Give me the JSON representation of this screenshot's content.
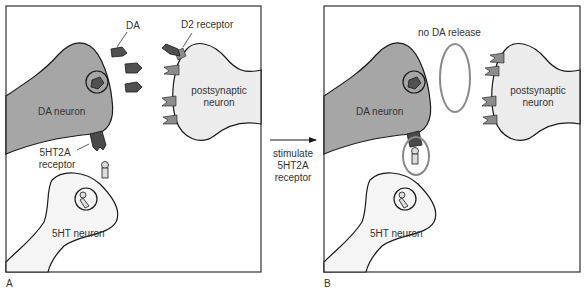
{
  "colors": {
    "da_neuron_fill": "#a6a6a6",
    "postsynaptic_fill": "#ececec",
    "serotonin_neuron_fill": "#f5f5f5",
    "dopamine_molecule": "#505050",
    "d2_receptor": "#8c8c8c",
    "receptor_5ht2a": "#4a4a4a",
    "serotonin_molecule": "#dcdcdc",
    "highlight_ellipse": "#8a8a8a",
    "outline": "#1a1a1a"
  },
  "panel_a": {
    "letter": "A",
    "labels": {
      "da": "DA",
      "d2_receptor": "D2 receptor",
      "da_neuron": "DA neuron",
      "postsynaptic_line1": "postsynaptic",
      "postsynaptic_line2": "neuron",
      "receptor_line1": "5HT2A",
      "receptor_line2": "receptor",
      "serotonin_neuron": "5HT neuron"
    }
  },
  "arrow": {
    "line1": "stimulate",
    "line2": "5HT2A",
    "line3": "receptor"
  },
  "panel_b": {
    "letter": "B",
    "labels": {
      "no_release": "no DA release",
      "da_neuron": "DA neuron",
      "postsynaptic_line1": "postsynaptic",
      "postsynaptic_line2": "neuron",
      "serotonin_neuron": "5HT neuron"
    }
  }
}
